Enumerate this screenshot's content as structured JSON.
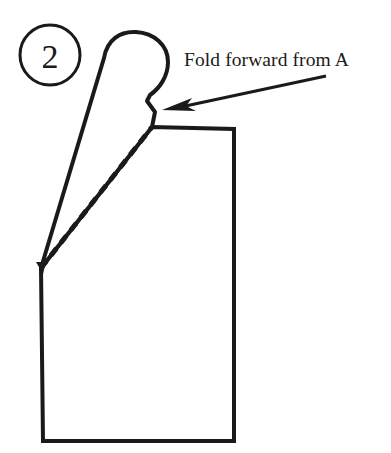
{
  "figure": {
    "title": "Fold forward from A",
    "background_color": "#ffffff",
    "ink_color": "#1a1a1a",
    "step_badge": {
      "label": "2",
      "shape": "circle"
    },
    "caption": {
      "text": "Fold forward from A",
      "x": 184,
      "y": 66
    },
    "annotations": {
      "arrow_label": "arrow pointing to fold point",
      "fold_line_label": "dashed fold line",
      "flap_label": "fold-forward flap",
      "body_label": "main body panel",
      "point_a_label": "A"
    },
    "geometry": {
      "badge_circle": {
        "cx": 50,
        "cy": 55,
        "r": 30,
        "stroke_width": 3
      },
      "point_a": {
        "x": 41,
        "y": 268
      },
      "fold_top": {
        "x": 152,
        "y": 127
      },
      "body_top_right": {
        "x": 234,
        "y": 129
      },
      "body_bottom_right": {
        "x": 234,
        "y": 441
      },
      "body_bottom_left": {
        "x": 43,
        "y": 441
      },
      "arrow_tail": {
        "x": 326,
        "y": 76
      },
      "arrow_tip": {
        "x": 162,
        "y": 110
      },
      "stroke_width_outline": 4,
      "stroke_width_fold": 5,
      "fold_dash_pattern": "9 7"
    }
  }
}
